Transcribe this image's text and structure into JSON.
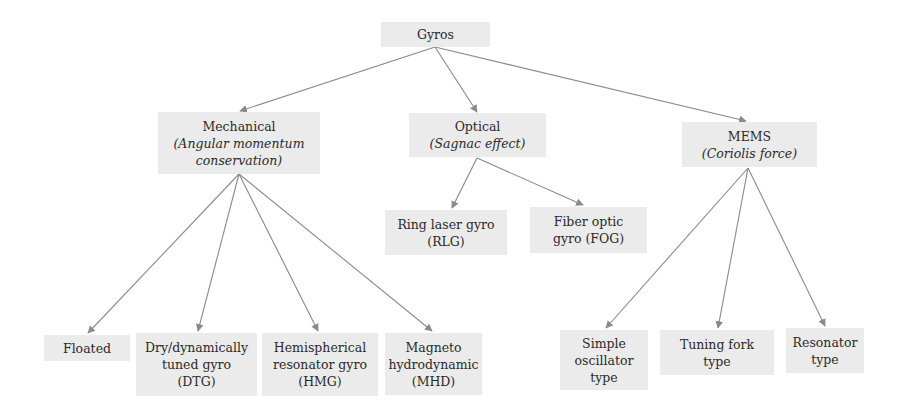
{
  "diagram": {
    "type": "tree",
    "colors": {
      "node_fill": "#ebebeb",
      "edge": "#8a8a8a",
      "text": "#2a2a2a",
      "background": "#ffffff"
    },
    "root": {
      "id": "gyros",
      "label": "Gyros"
    },
    "categories": [
      {
        "id": "mechanical",
        "label": "Mechanical",
        "principle": "(Angular momentum conservation)",
        "principle_lines": [
          "(Angular momentum",
          "conservation)"
        ]
      },
      {
        "id": "optical",
        "label": "Optical",
        "principle": "(Sagnac effect)"
      },
      {
        "id": "mems",
        "label": "MEMS",
        "principle": "(Coriolis force)"
      }
    ],
    "leaves": {
      "mechanical": [
        {
          "id": "floated",
          "lines": [
            "Floated"
          ]
        },
        {
          "id": "dtg",
          "lines": [
            "Dry/dynamically",
            "tuned gyro",
            "(DTG)"
          ]
        },
        {
          "id": "hmg",
          "lines": [
            "Hemispherical",
            "resonator gyro",
            "(HMG)"
          ]
        },
        {
          "id": "mhd",
          "lines": [
            "Magneto",
            "hydrodynamic",
            "(MHD)"
          ]
        }
      ],
      "optical": [
        {
          "id": "rlg",
          "lines": [
            "Ring laser gyro",
            "(RLG)"
          ]
        },
        {
          "id": "fog",
          "lines": [
            "Fiber optic",
            "gyro (FOG)"
          ]
        }
      ],
      "mems": [
        {
          "id": "simple",
          "lines": [
            "Simple",
            "oscillator",
            "type"
          ]
        },
        {
          "id": "tuning",
          "lines": [
            "Tuning fork",
            "type"
          ]
        },
        {
          "id": "resonator",
          "lines": [
            "Resonator",
            "type"
          ]
        }
      ]
    },
    "edges": [
      [
        "gyros",
        "mechanical"
      ],
      [
        "gyros",
        "optical"
      ],
      [
        "gyros",
        "mems"
      ],
      [
        "mechanical",
        "floated"
      ],
      [
        "mechanical",
        "dtg"
      ],
      [
        "mechanical",
        "hmg"
      ],
      [
        "mechanical",
        "mhd"
      ],
      [
        "optical",
        "rlg"
      ],
      [
        "optical",
        "fog"
      ],
      [
        "mems",
        "simple"
      ],
      [
        "mems",
        "tuning"
      ],
      [
        "mems",
        "resonator"
      ]
    ]
  }
}
